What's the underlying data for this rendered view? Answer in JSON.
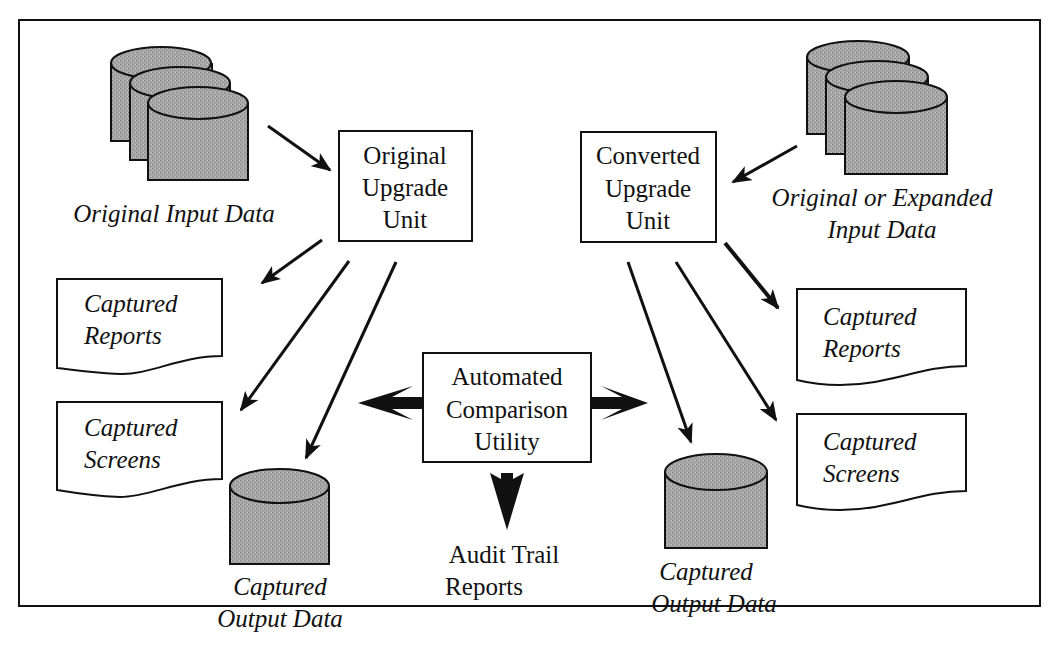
{
  "diagram": {
    "title": "",
    "colors": {
      "ink": "#111111",
      "cylinder_fill": "#a9a9a9",
      "background": "#ffffff"
    },
    "nodes": {
      "original_input": {
        "label": [
          "Original Input Data"
        ],
        "shape": "stacked-cylinders"
      },
      "original_unit": {
        "label": [
          "Original",
          "Upgrade",
          "Unit"
        ],
        "shape": "box"
      },
      "converted_unit": {
        "label": [
          "Converted",
          "Upgrade",
          "Unit"
        ],
        "shape": "box"
      },
      "expanded_input": {
        "label": [
          "Original or Expanded",
          "Input Data"
        ],
        "shape": "stacked-cylinders"
      },
      "left_reports": {
        "label": [
          "Captured",
          "Reports"
        ],
        "shape": "document"
      },
      "left_screens": {
        "label": [
          "Captured",
          "Screens"
        ],
        "shape": "document"
      },
      "left_output": {
        "label": [
          "Captured",
          "Output Data"
        ],
        "shape": "cylinder"
      },
      "comparison": {
        "label": [
          "Automated",
          "Comparison",
          "Utility"
        ],
        "shape": "box"
      },
      "audit": {
        "label": [
          "Audit Trail",
          "Reports"
        ],
        "shape": "text"
      },
      "right_output": {
        "label": [
          "Captured",
          "Output Data"
        ],
        "shape": "cylinder"
      },
      "right_reports": {
        "label": [
          "Captured",
          "Reports"
        ],
        "shape": "document"
      },
      "right_screens": {
        "label": [
          "Captured",
          "Screens"
        ],
        "shape": "document"
      }
    },
    "edges": [
      {
        "from": "original_input",
        "to": "original_unit"
      },
      {
        "from": "expanded_input",
        "to": "converted_unit"
      },
      {
        "from": "original_unit",
        "to": "left_reports"
      },
      {
        "from": "original_unit",
        "to": "left_screens"
      },
      {
        "from": "original_unit",
        "to": "left_output"
      },
      {
        "from": "converted_unit",
        "to": "right_output"
      },
      {
        "from": "converted_unit",
        "to": "right_screens"
      },
      {
        "from": "converted_unit",
        "to": "right_reports"
      },
      {
        "from": "comparison",
        "to": "left_outputs",
        "style": "bold"
      },
      {
        "from": "comparison",
        "to": "right_outputs",
        "style": "bold"
      },
      {
        "from": "comparison",
        "to": "audit",
        "style": "bold"
      }
    ]
  }
}
